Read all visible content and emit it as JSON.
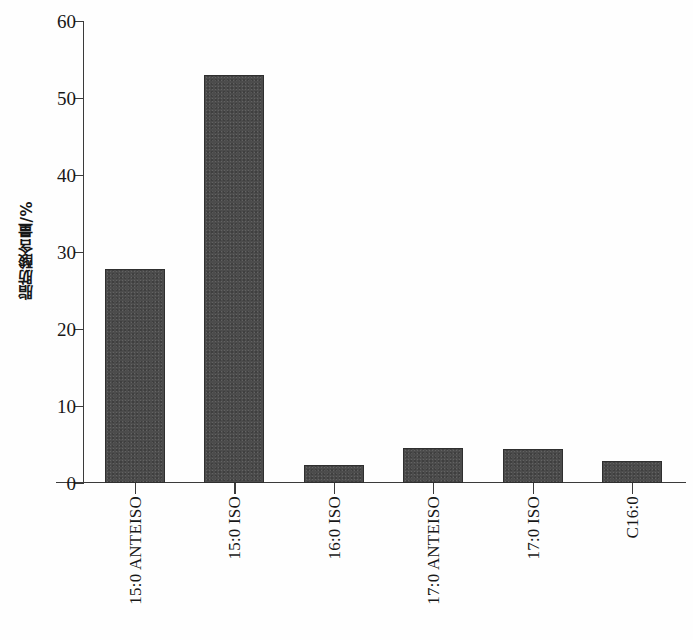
{
  "chart_data": {
    "type": "bar",
    "title": "",
    "subtitle": "",
    "xlabel": "",
    "ylabel": "脂肪酸含量/%",
    "categories": [
      "15:0 ANTEISO",
      "15:0 ISO",
      "16:0 ISO",
      "17:0 ANTEISO",
      "17:0 ISO",
      "C16:0"
    ],
    "values": [
      27.8,
      53.0,
      2.4,
      4.5,
      4.4,
      2.8
    ],
    "ylim": [
      0,
      60
    ],
    "ytick_labels": [
      "0",
      "10",
      "20",
      "30",
      "40",
      "50",
      "60"
    ],
    "ytick_values": [
      0,
      10,
      20,
      30,
      40,
      50,
      60
    ],
    "grid": false,
    "legend": false,
    "legend_position": "none",
    "bar_color": "#4c4c4c",
    "axis_color": "#3b3b3b",
    "background_color": "#ffffff"
  },
  "axis": {
    "y_title": "脂肪酸含量/%"
  }
}
